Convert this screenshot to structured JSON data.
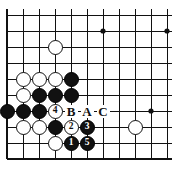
{
  "diagram": {
    "type": "go-board-problem",
    "board": {
      "grid_spacing": 16,
      "origin_x": 7,
      "origin_y": 15,
      "cols": 11,
      "rows": 10,
      "edges": {
        "left": true,
        "bottom": true,
        "top": false,
        "right": false
      },
      "line_color": "#111111",
      "board_color": "#ffffff"
    },
    "star_points": [
      {
        "col": 6,
        "row": 1
      },
      {
        "col": 10,
        "row": 1
      },
      {
        "col": 9,
        "row": 6
      }
    ],
    "stones": [
      {
        "col": 3,
        "row": 2,
        "color": "white",
        "label": ""
      },
      {
        "col": 1,
        "row": 4,
        "color": "white",
        "label": ""
      },
      {
        "col": 2,
        "row": 4,
        "color": "white",
        "label": ""
      },
      {
        "col": 3,
        "row": 4,
        "color": "white",
        "label": ""
      },
      {
        "col": 4,
        "row": 4,
        "color": "black",
        "label": ""
      },
      {
        "col": 1,
        "row": 5,
        "color": "white",
        "label": ""
      },
      {
        "col": 2,
        "row": 5,
        "color": "black",
        "label": ""
      },
      {
        "col": 3,
        "row": 5,
        "color": "black",
        "label": ""
      },
      {
        "col": 4,
        "row": 5,
        "color": "black",
        "label": ""
      },
      {
        "col": 0,
        "row": 6,
        "color": "black",
        "label": ""
      },
      {
        "col": 1,
        "row": 6,
        "color": "black",
        "label": ""
      },
      {
        "col": 2,
        "row": 6,
        "color": "black",
        "label": ""
      },
      {
        "col": 3,
        "row": 6,
        "color": "white",
        "label": "4"
      },
      {
        "col": 1,
        "row": 7,
        "color": "white",
        "label": ""
      },
      {
        "col": 2,
        "row": 7,
        "color": "white",
        "label": ""
      },
      {
        "col": 3,
        "row": 7,
        "color": "black",
        "label": ""
      },
      {
        "col": 4,
        "row": 7,
        "color": "white",
        "label": "2"
      },
      {
        "col": 5,
        "row": 7,
        "color": "black",
        "label": "3"
      },
      {
        "col": 8,
        "row": 7,
        "color": "white",
        "label": ""
      },
      {
        "col": 3,
        "row": 8,
        "color": "white",
        "label": ""
      },
      {
        "col": 4,
        "row": 8,
        "color": "black",
        "label": "1"
      },
      {
        "col": 5,
        "row": 8,
        "color": "black",
        "label": "5"
      }
    ],
    "point_labels": [
      {
        "col": 4,
        "row": 6,
        "text": "B"
      },
      {
        "col": 5,
        "row": 6,
        "text": "A"
      },
      {
        "col": 6,
        "row": 6,
        "text": "C"
      }
    ],
    "move_sequence": [
      "1",
      "2",
      "3",
      "4",
      "5"
    ],
    "colors": {
      "black_stone": "#111111",
      "white_stone": "#ffffff",
      "stone_outline": "#111111",
      "grid": "#111111",
      "label_text": "#111111"
    }
  }
}
